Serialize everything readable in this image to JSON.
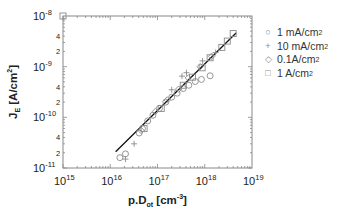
{
  "chart_data": {
    "type": "scatter",
    "title": "",
    "xlabel": "p.D_ot [cm^-3]",
    "ylabel": "J_E [A/cm^2]",
    "xscale": "log",
    "yscale": "log",
    "xlim": [
      1000000000000000.0,
      1e+19
    ],
    "ylim": [
      1e-11,
      1e-08
    ],
    "x_tick_labels": [
      "10^15",
      "10^16",
      "10^17",
      "10^18",
      "10^19"
    ],
    "y_tick_labels": [
      "10^-11",
      "2",
      "4",
      "10^-10",
      "2",
      "4",
      "10^-9",
      "2",
      "4",
      "10^-8"
    ],
    "grid": false,
    "legend_position": "right",
    "fit_line": {
      "x": [
        1.3e+16,
        4.6e+18
      ],
      "y": [
        2.1e-11,
        4.6e-09
      ]
    },
    "series": [
      {
        "name": "1 mA/cm2",
        "marker": "circle",
        "points": [
          [
            1.6e+16,
            1.6e-11
          ],
          [
            2.1e+16,
            1.9e-11
          ],
          [
            4.1e+16,
            4.9e-11
          ],
          [
            4.8e+16,
            6e-11
          ],
          [
            6.2e+16,
            8.5e-11
          ],
          [
            8e+16,
            1.1e-10
          ],
          [
            1.1e+17,
            1.5e-10
          ],
          [
            1.5e+17,
            2e-10
          ],
          [
            2e+17,
            2.5e-10
          ],
          [
            2.6e+17,
            3e-10
          ],
          [
            3.5e+17,
            3.7e-10
          ],
          [
            4.6e+17,
            4.3e-10
          ],
          [
            6.3e+17,
            5.1e-10
          ],
          [
            8.5e+17,
            5.6e-10
          ],
          [
            1.3e+18,
            6.6e-10
          ]
        ]
      },
      {
        "name": "10 mA/cm2",
        "marker": "plus",
        "points": [
          [
            2.1e+16,
            1.5e-11
          ],
          [
            3.2e+16,
            3e-11
          ],
          [
            2e+17,
            3.5e-10
          ],
          [
            3.3e+17,
            6.5e-10
          ],
          [
            4.1e+17,
            7.6e-10
          ],
          [
            9e+17,
            1.3e-09
          ],
          [
            1.7e+18,
            1.9e-09
          ]
        ]
      },
      {
        "name": "0.1A/cm2",
        "marker": "diamond",
        "points": [
          [
            4.5e+16,
            5.5e-11
          ],
          [
            9e+16,
            1.3e-10
          ],
          [
            1.6e+17,
            2.2e-10
          ],
          [
            2.8e+17,
            3.6e-10
          ],
          [
            4.5e+17,
            6e-10
          ],
          [
            8e+17,
            1e-09
          ],
          [
            1.4e+18,
            1.6e-09
          ]
        ]
      },
      {
        "name": "1 A/cm2",
        "marker": "square",
        "points": [
          [
            1000000000000000.0,
            1e-08
          ],
          [
            5.2e+16,
            6e-11
          ],
          [
            1.2e+17,
            1.5e-10
          ],
          [
            3.5e+17,
            4.3e-10
          ],
          [
            5.5e+17,
            6.2e-10
          ],
          [
            8.8e+17,
            9.5e-10
          ],
          [
            1.3e+18,
            1.5e-09
          ],
          [
            2.3e+18,
            2.4e-09
          ],
          [
            3e+18,
            3.2e-09
          ],
          [
            4e+18,
            4.5e-09
          ]
        ]
      }
    ]
  },
  "legend": [
    {
      "symbol": "○",
      "label": "1 mA/cm",
      "sup": "2"
    },
    {
      "symbol": "+",
      "label": "10 mA/cm",
      "sup": "2"
    },
    {
      "symbol": "◇",
      "label": "0.1A/cm",
      "sup": "2"
    },
    {
      "symbol": "□",
      "label": "1 A/cm",
      "sup": "2"
    }
  ],
  "axes": {
    "ylabel_main": "J",
    "ylabel_sub": "E",
    "ylabel_rest": " [A/cm",
    "ylabel_sup": "2",
    "ylabel_end": "]",
    "xlabel_main": "p.D",
    "xlabel_sub": "ot",
    "xlabel_rest": " [cm",
    "xlabel_sup": "-3",
    "xlabel_end": "]"
  },
  "colors": {
    "axis": "#777777",
    "line": "#111111",
    "marker": "#8a8a8a",
    "text": "#222222"
  }
}
